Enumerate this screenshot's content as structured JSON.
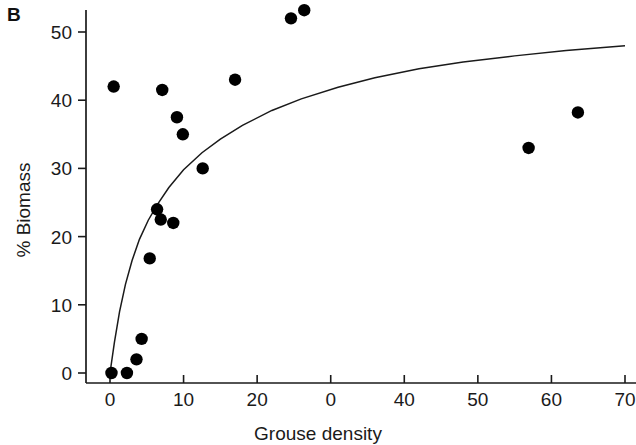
{
  "figure": {
    "panel_label": "B"
  },
  "chart_data": {
    "type": "scatter",
    "title": "",
    "subtitle": "",
    "xlabel": "Grouse density",
    "ylabel": "% Biomass",
    "xlim": [
      -3,
      70
    ],
    "ylim": [
      -2,
      55
    ],
    "grid": false,
    "legend": null,
    "xticks": [
      0,
      10,
      20,
      30,
      40,
      50,
      60,
      70
    ],
    "xticklabels": [
      "0",
      "10",
      "20",
      "0",
      "40",
      "50",
      "60",
      "70"
    ],
    "yticks": [
      0,
      10,
      20,
      30,
      40,
      50
    ],
    "yticklabels": [
      "0",
      "10",
      "20",
      "30",
      "40",
      "50"
    ],
    "series": [
      {
        "name": "observations",
        "marker": "filled-circle",
        "color": "#000000",
        "points": [
          {
            "x": 0.2,
            "y": 0.0
          },
          {
            "x": 0.5,
            "y": 42.0
          },
          {
            "x": 2.3,
            "y": 0.0
          },
          {
            "x": 3.6,
            "y": 2.0
          },
          {
            "x": 4.3,
            "y": 5.0
          },
          {
            "x": 5.4,
            "y": 16.8
          },
          {
            "x": 6.4,
            "y": 24.0
          },
          {
            "x": 6.9,
            "y": 22.5
          },
          {
            "x": 7.1,
            "y": 41.5
          },
          {
            "x": 8.6,
            "y": 22.0
          },
          {
            "x": 9.1,
            "y": 37.5
          },
          {
            "x": 9.9,
            "y": 35.0
          },
          {
            "x": 12.6,
            "y": 30.0
          },
          {
            "x": 17.0,
            "y": 43.0
          },
          {
            "x": 24.6,
            "y": 52.0
          },
          {
            "x": 26.4,
            "y": 53.2
          },
          {
            "x": 56.9,
            "y": 33.0
          },
          {
            "x": 63.6,
            "y": 38.2
          }
        ]
      },
      {
        "name": "fitted-curve",
        "marker": "none",
        "color": "#1a1a1a",
        "description": "saturating asymptotic fit rising steeply from origin to about 48% biomass at density 70",
        "points": [
          {
            "x": 0.0,
            "y": 0.0
          },
          {
            "x": 0.6,
            "y": 4.5
          },
          {
            "x": 1.3,
            "y": 9.0
          },
          {
            "x": 2.1,
            "y": 13.0
          },
          {
            "x": 3.0,
            "y": 16.5
          },
          {
            "x": 4.0,
            "y": 19.6
          },
          {
            "x": 5.2,
            "y": 22.4
          },
          {
            "x": 6.5,
            "y": 24.8
          },
          {
            "x": 8.0,
            "y": 27.2
          },
          {
            "x": 10.0,
            "y": 29.8
          },
          {
            "x": 12.5,
            "y": 32.3
          },
          {
            "x": 15.0,
            "y": 34.3
          },
          {
            "x": 18.0,
            "y": 36.3
          },
          {
            "x": 22.0,
            "y": 38.5
          },
          {
            "x": 26.0,
            "y": 40.2
          },
          {
            "x": 31.0,
            "y": 41.9
          },
          {
            "x": 36.0,
            "y": 43.3
          },
          {
            "x": 42.0,
            "y": 44.6
          },
          {
            "x": 48.0,
            "y": 45.6
          },
          {
            "x": 55.0,
            "y": 46.5
          },
          {
            "x": 62.0,
            "y": 47.3
          },
          {
            "x": 70.0,
            "y": 48.0
          }
        ]
      }
    ]
  }
}
